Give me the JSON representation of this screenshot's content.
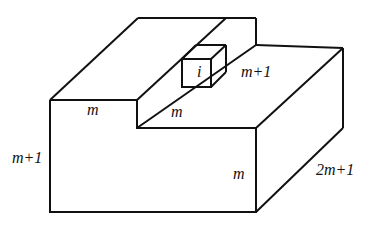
{
  "diagram": {
    "labels": {
      "top_left_width": "m",
      "step_width": "m",
      "cube": "i",
      "cube_depth": "m+1",
      "left_height": "m+1",
      "front_right_height": "m",
      "right_depth": "2m+1"
    },
    "stroke_color": "#111111"
  }
}
